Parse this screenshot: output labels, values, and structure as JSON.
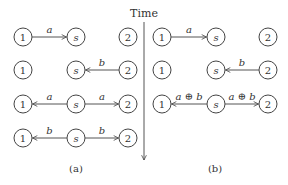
{
  "time_axis": {
    "label": "Time"
  },
  "panels": [
    {
      "caption": "(a)",
      "rows": [
        {
          "nodes": [
            "1",
            "s",
            "2"
          ],
          "edges": [
            {
              "from": 0,
              "to": 1,
              "label": "a"
            }
          ]
        },
        {
          "nodes": [
            "1",
            "s",
            "2"
          ],
          "edges": [
            {
              "from": 2,
              "to": 1,
              "label": "b"
            }
          ]
        },
        {
          "nodes": [
            "1",
            "s",
            "2"
          ],
          "edges": [
            {
              "from": 1,
              "to": 0,
              "label": "a"
            },
            {
              "from": 1,
              "to": 2,
              "label": "a"
            }
          ]
        },
        {
          "nodes": [
            "1",
            "s",
            "2"
          ],
          "edges": [
            {
              "from": 1,
              "to": 0,
              "label": "b"
            },
            {
              "from": 1,
              "to": 2,
              "label": "b"
            }
          ]
        }
      ]
    },
    {
      "caption": "(b)",
      "rows": [
        {
          "nodes": [
            "1",
            "s",
            "2"
          ],
          "edges": [
            {
              "from": 0,
              "to": 1,
              "label": "a"
            }
          ]
        },
        {
          "nodes": [
            "1",
            "s",
            "2"
          ],
          "edges": [
            {
              "from": 2,
              "to": 1,
              "label": "b"
            }
          ]
        },
        {
          "nodes": [
            "1",
            "s",
            "2"
          ],
          "edges": [
            {
              "from": 1,
              "to": 0,
              "label": "a ⊕ b"
            },
            {
              "from": 1,
              "to": 2,
              "label": "a ⊕ b"
            }
          ]
        }
      ]
    }
  ]
}
